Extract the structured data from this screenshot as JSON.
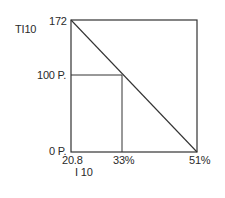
{
  "diagram": {
    "y_axis_title": "TI10",
    "x_axis_title": "I 10",
    "y_ticks": [
      {
        "label": "172",
        "value": 172
      },
      {
        "label": "100 P.",
        "value": 100
      },
      {
        "label": "0 P.",
        "value": 0
      }
    ],
    "x_ticks": [
      {
        "label": "20.8",
        "value": 20.8
      },
      {
        "label": "33%",
        "value": 33
      },
      {
        "label": "51%",
        "value": 51
      }
    ],
    "lines": [
      {
        "name": "diagonal",
        "from": [
          20.8,
          172
        ],
        "to": [
          51,
          0
        ]
      },
      {
        "name": "horizontal-100P",
        "from": [
          20.8,
          100
        ],
        "to": [
          33,
          100
        ]
      },
      {
        "name": "vertical-33",
        "from": [
          33,
          100
        ],
        "to": [
          33,
          0
        ]
      }
    ],
    "line_color": "#333333"
  }
}
